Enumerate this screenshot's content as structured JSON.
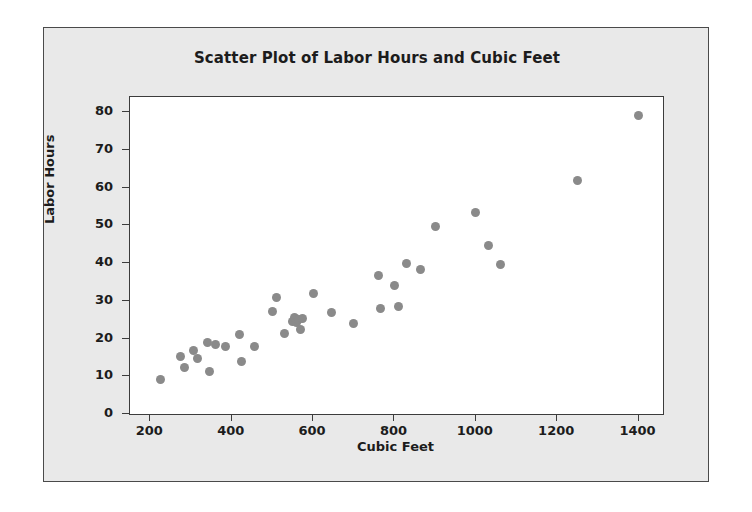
{
  "chart_data": {
    "type": "scatter",
    "title": "Scatter Plot of Labor Hours and Cubic Feet",
    "xlabel": "Cubic Feet",
    "ylabel": "Labor Hours",
    "xlim": [
      150,
      1460
    ],
    "ylim": [
      0,
      84
    ],
    "xticks": [
      200,
      400,
      600,
      800,
      1000,
      1200,
      1400
    ],
    "xtick_labels": [
      "200",
      "400",
      "600",
      "800",
      "1000",
      "1200",
      "1400"
    ],
    "yticks": [
      0,
      10,
      20,
      30,
      40,
      50,
      60,
      70,
      80
    ],
    "ytick_labels": [
      "0",
      "10",
      "20",
      "30",
      "40",
      "50",
      "60",
      "70",
      "80"
    ],
    "grid": false,
    "legend": false,
    "marker": {
      "shape": "circle",
      "color": "#8a8a8a",
      "size_px": 9
    },
    "series": [
      {
        "name": "Labor Hours vs Cubic Feet",
        "points": [
          [
            225,
            9.2
          ],
          [
            275,
            15.2
          ],
          [
            285,
            12.2
          ],
          [
            305,
            16.8
          ],
          [
            315,
            14.8
          ],
          [
            340,
            19.0
          ],
          [
            345,
            11.2
          ],
          [
            360,
            18.4
          ],
          [
            385,
            18.0
          ],
          [
            420,
            21.0
          ],
          [
            425,
            13.8
          ],
          [
            455,
            18.0
          ],
          [
            500,
            27.2
          ],
          [
            510,
            31.0
          ],
          [
            530,
            21.2
          ],
          [
            550,
            24.5
          ],
          [
            555,
            25.6
          ],
          [
            560,
            24.2
          ],
          [
            565,
            25.0
          ],
          [
            570,
            22.4
          ],
          [
            575,
            25.2
          ],
          [
            600,
            31.8
          ],
          [
            645,
            27.0
          ],
          [
            700,
            24.0
          ],
          [
            760,
            36.8
          ],
          [
            765,
            28.0
          ],
          [
            800,
            34.0
          ],
          [
            810,
            28.6
          ],
          [
            830,
            40.0
          ],
          [
            865,
            38.4
          ],
          [
            900,
            49.6
          ],
          [
            1000,
            53.4
          ],
          [
            1030,
            44.6
          ],
          [
            1060,
            39.6
          ],
          [
            1250,
            62.0
          ],
          [
            1400,
            79.2
          ]
        ]
      }
    ]
  },
  "figure": {
    "background_color": "#e9e9e9",
    "plot_background_color": "#ffffff",
    "border_color": "#4a4a4a"
  }
}
